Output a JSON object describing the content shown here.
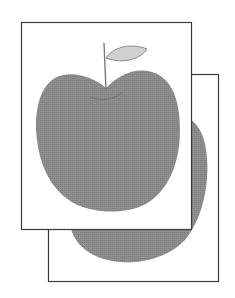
{
  "illustration": {
    "subject": "two stacked picture cards showing an apple",
    "colors": {
      "background": "#ffffff",
      "frame_stroke": "#3a3a3a",
      "card_fill": "#ffffff",
      "apple_fill": "#8c8c8c",
      "leaf_fill": "#cfcfcf",
      "leaf_stroke": "#8a8a8a",
      "stem": "#7a7a7a"
    },
    "back_card": {
      "x": 48,
      "y": 74,
      "width": 171,
      "height": 208
    },
    "front_card": {
      "x": 21,
      "y": 22,
      "width": 171,
      "height": 208
    }
  }
}
